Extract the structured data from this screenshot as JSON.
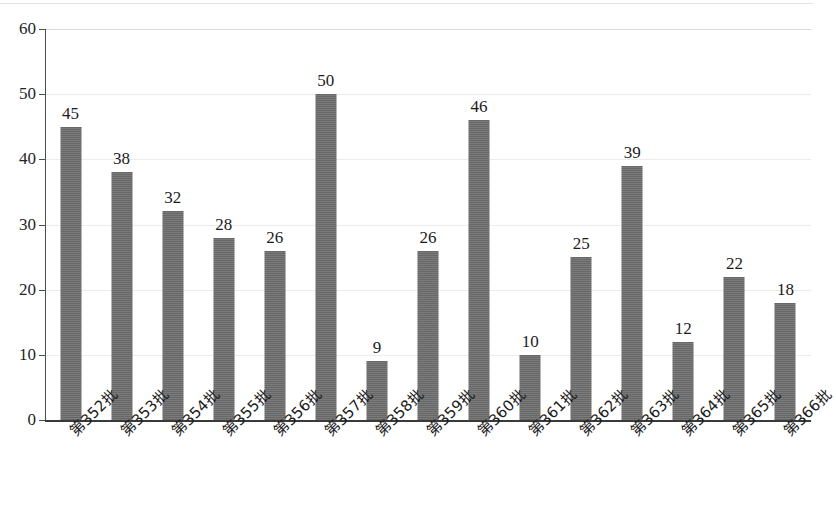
{
  "chart_data": {
    "type": "bar",
    "title": "",
    "subtitle": "",
    "xlabel": "",
    "ylabel": "",
    "categories": [
      "第352批",
      "第353批",
      "第354批",
      "第355批",
      "第356批",
      "第357批",
      "第358批",
      "第359批",
      "第360批",
      "第361批",
      "第362批",
      "第363批",
      "第364批",
      "第365批",
      "第366批"
    ],
    "values": [
      45,
      38,
      32,
      28,
      26,
      50,
      9,
      26,
      46,
      10,
      25,
      39,
      12,
      22,
      18
    ],
    "data_labels": [
      "45",
      "38",
      "32",
      "28",
      "26",
      "50",
      "9",
      "26",
      "46",
      "10",
      "25",
      "39",
      "12",
      "22",
      "18"
    ],
    "ylim": [
      0,
      60
    ],
    "ytick_values": [
      0,
      10,
      20,
      30,
      40,
      50,
      60
    ],
    "ytick_labels": [
      "0",
      "10",
      "20",
      "30",
      "40",
      "50",
      "60"
    ],
    "grid": true,
    "grid_axis": "y",
    "legend": false,
    "legend_position": "none",
    "series": [
      {
        "name": "",
        "color": "#6e6e6e",
        "values": [
          45,
          38,
          32,
          28,
          26,
          50,
          9,
          26,
          46,
          10,
          25,
          39,
          12,
          22,
          18
        ]
      }
    ],
    "xtick_rotation": -45,
    "bar_color": "#6e6e6e",
    "axis_color": "#3a3a3a",
    "grid_color": "#ececec",
    "background_color": "#ffffff"
  }
}
